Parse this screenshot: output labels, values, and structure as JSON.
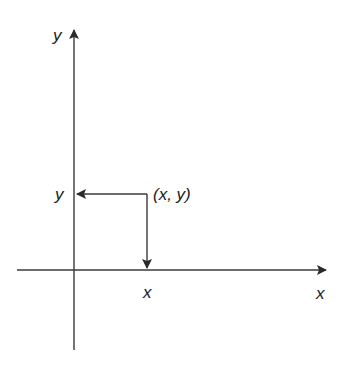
{
  "diagram": {
    "type": "cartesian-coordinate-plane",
    "axes": {
      "x_axis_label": "x",
      "y_axis_label": "y",
      "line_color": "#3a3a3a"
    },
    "point": {
      "label": "(x, y)",
      "x_projection_label": "x",
      "y_projection_label": "y"
    }
  }
}
